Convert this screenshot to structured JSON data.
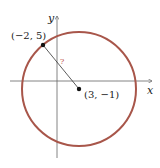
{
  "diagram": {
    "type": "circle-on-coordinate-plane",
    "axes": {
      "x_label": "x",
      "y_label": "y"
    },
    "center": {
      "label": "(3, −1)",
      "x": 3,
      "y": -1
    },
    "point_on_circle": {
      "label": "(−2, 5)",
      "x": -2,
      "y": 5
    },
    "radius_label": "?",
    "colors": {
      "circle": "#a8564a",
      "axes": "#555555",
      "radius_label": "#c0504d",
      "points": "#111111"
    }
  }
}
